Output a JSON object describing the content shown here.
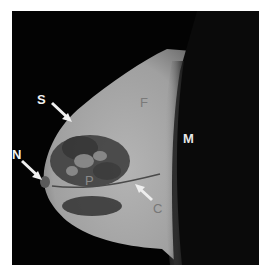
{
  "image": {
    "description": "Sagittal breast MRI with anatomical labels",
    "labels": {
      "S": "S",
      "N": "N",
      "F": "F",
      "M": "M",
      "P": "P",
      "C": "C"
    },
    "colors": {
      "background": "#030303",
      "tissue": "#a8a8a8",
      "label_white": "#f2f2f2",
      "label_gray": "#7a7a7a"
    }
  }
}
